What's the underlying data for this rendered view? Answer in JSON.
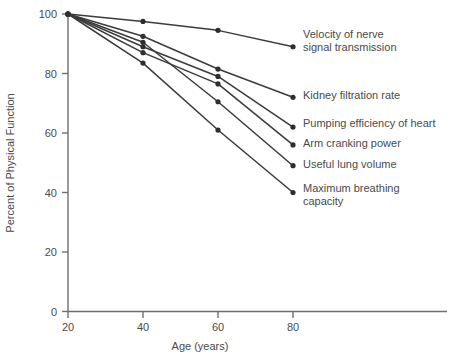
{
  "chart_data": {
    "type": "line",
    "title": "",
    "xlabel": "Age (years)",
    "ylabel": "Percent of Physical Function",
    "x": [
      20,
      40,
      60,
      80
    ],
    "xlim": [
      10,
      90
    ],
    "ylim": [
      0,
      100
    ],
    "xticks": [
      20,
      40,
      60,
      80
    ],
    "yticks": [
      0,
      20,
      40,
      60,
      80,
      100
    ],
    "xtick_labels": [
      "20",
      "40",
      "60",
      "80"
    ],
    "ytick_labels": [
      "0",
      "20",
      "40",
      "60",
      "80",
      "100"
    ],
    "grid": false,
    "legend_position": "right-inline-labels",
    "series": [
      {
        "name": "Velocity of nerve signal transmission",
        "label_lines": [
          "Velocity of nerve",
          "signal transmission"
        ],
        "values": [
          100,
          97.5,
          94.5,
          89
        ]
      },
      {
        "name": "Kidney filtration rate",
        "label_lines": [
          "Kidney filtration rate"
        ],
        "values": [
          100,
          92.5,
          81.5,
          72
        ]
      },
      {
        "name": "Pumping efficiency of heart",
        "label_lines": [
          "Pumping efficiency of heart"
        ],
        "values": [
          100,
          89,
          79,
          62
        ]
      },
      {
        "name": "Arm cranking power",
        "label_lines": [
          "Arm cranking power"
        ],
        "values": [
          100,
          87,
          76.5,
          56
        ]
      },
      {
        "name": "Useful lung volume",
        "label_lines": [
          "Useful lung volume"
        ],
        "values": [
          100,
          90.5,
          70.5,
          49
        ]
      },
      {
        "name": "Maximum breathing capacity",
        "label_lines": [
          "Maximum breathing",
          "capacity"
        ],
        "values": [
          100,
          83.5,
          61,
          40
        ]
      }
    ],
    "colors": {
      "line": "#3b3b3b",
      "marker": "#2e2e2e",
      "axis": "#6f6f6f",
      "text": "#4a4a4a",
      "background": "#ffffff"
    }
  },
  "labels": {
    "series_0_line_0": "Velocity of nerve",
    "series_0_line_1": "signal transmission",
    "series_1_line_0": "Kidney filtration rate",
    "series_2_line_0": "Pumping efficiency of heart",
    "series_3_line_0": "Arm cranking power",
    "series_4_line_0": "Useful lung volume",
    "series_5_line_0": "Maximum breathing",
    "series_5_line_1": "capacity"
  },
  "axes": {
    "x_title": "Age (years)",
    "y_title": "Percent of Physical Function",
    "x_tick_0": "20",
    "x_tick_1": "40",
    "x_tick_2": "60",
    "x_tick_3": "80",
    "y_tick_0": "0",
    "y_tick_1": "20",
    "y_tick_2": "40",
    "y_tick_3": "60",
    "y_tick_4": "80",
    "y_tick_5": "100"
  }
}
